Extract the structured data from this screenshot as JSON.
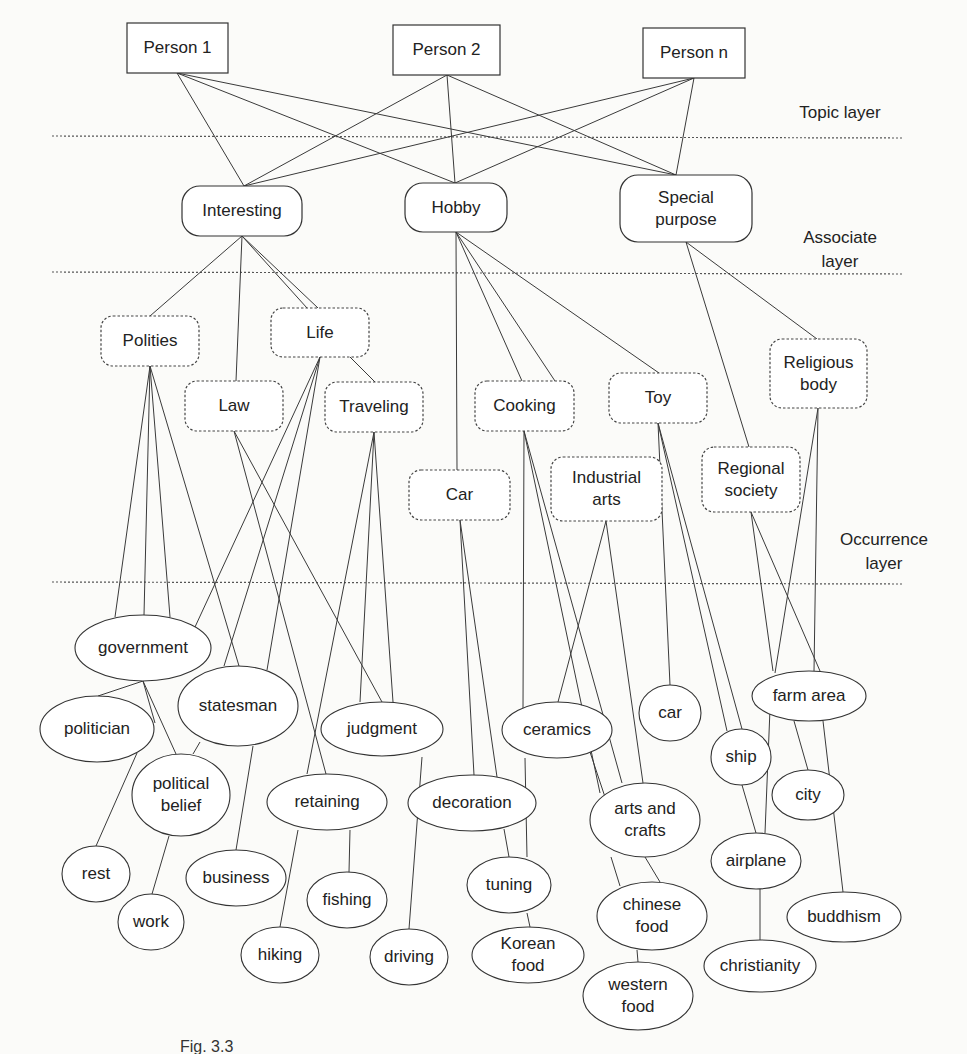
{
  "diagram": {
    "type": "layered-topic-graph",
    "layers": [
      {
        "id": "topic",
        "label_lines": [
          "Topic layer"
        ],
        "label_x": 840,
        "label_y": 118,
        "line_y": 136
      },
      {
        "id": "associate",
        "label_lines": [
          "Associate",
          "layer"
        ],
        "label_x": 840,
        "label_y": 243,
        "line_y": 272
      },
      {
        "id": "occurrence",
        "label_lines": [
          "Occurrence",
          "layer"
        ],
        "label_x": 884,
        "label_y": 545,
        "line_y": 582
      }
    ],
    "layer_line_x1": 52,
    "layer_line_x2": 902,
    "persons": [
      {
        "id": "p1",
        "label": "Person 1",
        "x": 127,
        "y": 23,
        "w": 101,
        "h": 50
      },
      {
        "id": "p2",
        "label": "Person 2",
        "x": 393,
        "y": 25,
        "w": 107,
        "h": 50
      },
      {
        "id": "pn",
        "label": "Person n",
        "x": 643,
        "y": 28,
        "w": 102,
        "h": 50
      }
    ],
    "topics": [
      {
        "id": "interesting",
        "label_lines": [
          "Interesting"
        ],
        "x": 182,
        "y": 186,
        "w": 120,
        "h": 50,
        "style": "round"
      },
      {
        "id": "hobby",
        "label_lines": [
          "Hobby"
        ],
        "x": 405,
        "y": 183,
        "w": 102,
        "h": 49,
        "style": "round"
      },
      {
        "id": "special",
        "label_lines": [
          "Special",
          "purpose"
        ],
        "x": 620,
        "y": 175,
        "w": 132,
        "h": 67,
        "style": "round"
      }
    ],
    "categories": [
      {
        "id": "polities",
        "label_lines": [
          "Polities"
        ],
        "x": 101,
        "y": 316,
        "w": 98,
        "h": 50
      },
      {
        "id": "life",
        "label_lines": [
          "Life"
        ],
        "x": 271,
        "y": 308,
        "w": 98,
        "h": 49
      },
      {
        "id": "law",
        "label_lines": [
          "Law"
        ],
        "x": 185,
        "y": 381,
        "w": 98,
        "h": 50
      },
      {
        "id": "traveling",
        "label_lines": [
          "Traveling"
        ],
        "x": 325,
        "y": 382,
        "w": 98,
        "h": 50
      },
      {
        "id": "car_cat",
        "label_lines": [
          "Car"
        ],
        "x": 409,
        "y": 470,
        "w": 101,
        "h": 50
      },
      {
        "id": "cooking",
        "label_lines": [
          "Cooking"
        ],
        "x": 475,
        "y": 381,
        "w": 99,
        "h": 50
      },
      {
        "id": "industrial",
        "label_lines": [
          "Industrial",
          "arts"
        ],
        "x": 551,
        "y": 457,
        "w": 111,
        "h": 64
      },
      {
        "id": "toy",
        "label_lines": [
          "Toy"
        ],
        "x": 609,
        "y": 373,
        "w": 98,
        "h": 50
      },
      {
        "id": "regional",
        "label_lines": [
          "Regional",
          "society"
        ],
        "x": 702,
        "y": 447,
        "w": 98,
        "h": 65
      },
      {
        "id": "religious",
        "label_lines": [
          "Religious",
          "body"
        ],
        "x": 770,
        "y": 339,
        "w": 97,
        "h": 69
      }
    ],
    "terms": [
      {
        "id": "government",
        "label_lines": [
          "government"
        ],
        "cx": 143,
        "cy": 648,
        "rx": 68,
        "ry": 33
      },
      {
        "id": "politician",
        "label_lines": [
          "politician"
        ],
        "cx": 97,
        "cy": 729,
        "rx": 57,
        "ry": 33
      },
      {
        "id": "statesman",
        "label_lines": [
          "statesman"
        ],
        "cx": 238,
        "cy": 706,
        "rx": 60,
        "ry": 40
      },
      {
        "id": "political_belief",
        "label_lines": [
          "political",
          "belief"
        ],
        "cx": 181,
        "cy": 795,
        "rx": 49,
        "ry": 41
      },
      {
        "id": "rest",
        "label_lines": [
          "rest"
        ],
        "cx": 96,
        "cy": 874,
        "rx": 34,
        "ry": 28
      },
      {
        "id": "work",
        "label_lines": [
          "work"
        ],
        "cx": 151,
        "cy": 922,
        "rx": 33,
        "ry": 28
      },
      {
        "id": "business",
        "label_lines": [
          "business"
        ],
        "cx": 236,
        "cy": 878,
        "rx": 50,
        "ry": 28
      },
      {
        "id": "judgment",
        "label_lines": [
          "judgment"
        ],
        "cx": 382,
        "cy": 729,
        "rx": 61,
        "ry": 27
      },
      {
        "id": "retaining",
        "label_lines": [
          "retaining"
        ],
        "cx": 327,
        "cy": 802,
        "rx": 60,
        "ry": 28
      },
      {
        "id": "fishing",
        "label_lines": [
          "fishing"
        ],
        "cx": 347,
        "cy": 900,
        "rx": 40,
        "ry": 28
      },
      {
        "id": "hiking",
        "label_lines": [
          "hiking"
        ],
        "cx": 280,
        "cy": 955,
        "rx": 39,
        "ry": 28
      },
      {
        "id": "driving",
        "label_lines": [
          "driving"
        ],
        "cx": 409,
        "cy": 957,
        "rx": 39,
        "ry": 28
      },
      {
        "id": "decoration",
        "label_lines": [
          "decoration"
        ],
        "cx": 472,
        "cy": 803,
        "rx": 64,
        "ry": 28
      },
      {
        "id": "tuning",
        "label_lines": [
          "tuning"
        ],
        "cx": 509,
        "cy": 885,
        "rx": 42,
        "ry": 28
      },
      {
        "id": "korean_food",
        "label_lines": [
          "Korean",
          "food"
        ],
        "cx": 528,
        "cy": 955,
        "rx": 56,
        "ry": 28
      },
      {
        "id": "ceramics",
        "label_lines": [
          "ceramics"
        ],
        "cx": 557,
        "cy": 730,
        "rx": 55,
        "ry": 28
      },
      {
        "id": "car",
        "label_lines": [
          "car"
        ],
        "cx": 670,
        "cy": 713,
        "rx": 31,
        "ry": 28
      },
      {
        "id": "arts_crafts",
        "label_lines": [
          "arts and",
          "crafts"
        ],
        "cx": 645,
        "cy": 820,
        "rx": 55,
        "ry": 37
      },
      {
        "id": "chinese_food",
        "label_lines": [
          "chinese",
          "food"
        ],
        "cx": 652,
        "cy": 916,
        "rx": 55,
        "ry": 34
      },
      {
        "id": "western_food",
        "label_lines": [
          "western",
          "food"
        ],
        "cx": 638,
        "cy": 996,
        "rx": 55,
        "ry": 34
      },
      {
        "id": "farm_area",
        "label_lines": [
          "farm area"
        ],
        "cx": 809,
        "cy": 696,
        "rx": 57,
        "ry": 25
      },
      {
        "id": "ship",
        "label_lines": [
          "ship"
        ],
        "cx": 741,
        "cy": 757,
        "rx": 30,
        "ry": 28
      },
      {
        "id": "city",
        "label_lines": [
          "city"
        ],
        "cx": 808,
        "cy": 795,
        "rx": 36,
        "ry": 25
      },
      {
        "id": "airplane",
        "label_lines": [
          "airplane"
        ],
        "cx": 756,
        "cy": 861,
        "rx": 45,
        "ry": 28
      },
      {
        "id": "christianity",
        "label_lines": [
          "christianity"
        ],
        "cx": 760,
        "cy": 966,
        "rx": 56,
        "ry": 26
      },
      {
        "id": "buddhism",
        "label_lines": [
          "buddhism"
        ],
        "cx": 844,
        "cy": 917,
        "rx": 57,
        "ry": 25
      }
    ],
    "edges": [
      [
        177,
        73,
        244,
        186
      ],
      [
        177,
        73,
        455,
        183
      ],
      [
        177,
        73,
        676,
        175
      ],
      [
        447,
        75,
        244,
        186
      ],
      [
        447,
        75,
        455,
        183
      ],
      [
        447,
        75,
        676,
        175
      ],
      [
        694,
        78,
        244,
        186
      ],
      [
        694,
        78,
        455,
        183
      ],
      [
        694,
        78,
        676,
        175
      ],
      [
        242,
        236,
        150,
        316
      ],
      [
        242,
        236,
        236,
        381
      ],
      [
        242,
        236,
        307,
        308
      ],
      [
        242,
        236,
        318,
        308
      ],
      [
        456,
        232,
        457,
        470
      ],
      [
        456,
        232,
        522,
        381
      ],
      [
        456,
        232,
        555,
        381
      ],
      [
        456,
        232,
        659,
        373
      ],
      [
        686,
        242,
        749,
        447
      ],
      [
        686,
        242,
        817,
        339
      ],
      [
        350,
        357,
        375,
        382
      ],
      [
        150,
        366,
        115,
        617
      ],
      [
        150,
        366,
        144,
        615
      ],
      [
        150,
        366,
        170,
        617
      ],
      [
        150,
        366,
        239,
        666
      ],
      [
        320,
        357,
        195,
        627
      ],
      [
        320,
        357,
        224,
        666
      ],
      [
        320,
        357,
        267,
        670
      ],
      [
        234,
        431,
        326,
        774
      ],
      [
        234,
        431,
        382,
        702
      ],
      [
        374,
        432,
        307,
        774
      ],
      [
        374,
        432,
        360,
        702
      ],
      [
        374,
        432,
        393,
        702
      ],
      [
        460,
        520,
        474,
        775
      ],
      [
        460,
        520,
        497,
        777
      ],
      [
        524,
        431,
        523,
        708
      ],
      [
        524,
        431,
        622,
        783
      ],
      [
        524,
        431,
        600,
        793
      ],
      [
        606,
        521,
        558,
        702
      ],
      [
        606,
        521,
        643,
        783
      ],
      [
        658,
        423,
        670,
        685
      ],
      [
        658,
        423,
        727,
        731
      ],
      [
        658,
        423,
        742,
        729
      ],
      [
        751,
        512,
        820,
        671
      ],
      [
        751,
        512,
        773,
        671
      ],
      [
        818,
        408,
        775,
        673
      ],
      [
        818,
        408,
        814,
        671
      ],
      [
        143,
        681,
        98,
        696
      ],
      [
        143,
        681,
        176,
        754
      ],
      [
        143,
        681,
        155,
        723
      ],
      [
        137,
        753,
        96,
        846
      ],
      [
        200,
        742,
        193,
        754
      ],
      [
        169,
        836,
        152,
        894
      ],
      [
        253,
        746,
        236,
        850
      ],
      [
        298,
        830,
        280,
        927
      ],
      [
        350,
        830,
        349,
        872
      ],
      [
        422,
        757,
        409,
        929
      ],
      [
        504,
        829,
        509,
        857
      ],
      [
        527,
        913,
        530,
        927
      ],
      [
        525,
        758,
        527,
        857
      ],
      [
        590,
        752,
        621,
        845
      ],
      [
        611,
        857,
        620,
        886
      ],
      [
        645,
        857,
        660,
        882
      ],
      [
        637,
        950,
        638,
        962
      ],
      [
        742,
        785,
        756,
        833
      ],
      [
        770,
        709,
        765,
        833
      ],
      [
        794,
        721,
        808,
        770
      ],
      [
        823,
        721,
        843,
        892
      ],
      [
        760,
        889,
        760,
        940
      ]
    ],
    "caption_visible_text": "Fig. 3.3",
    "caption_x": 180,
    "caption_y": 1052
  }
}
